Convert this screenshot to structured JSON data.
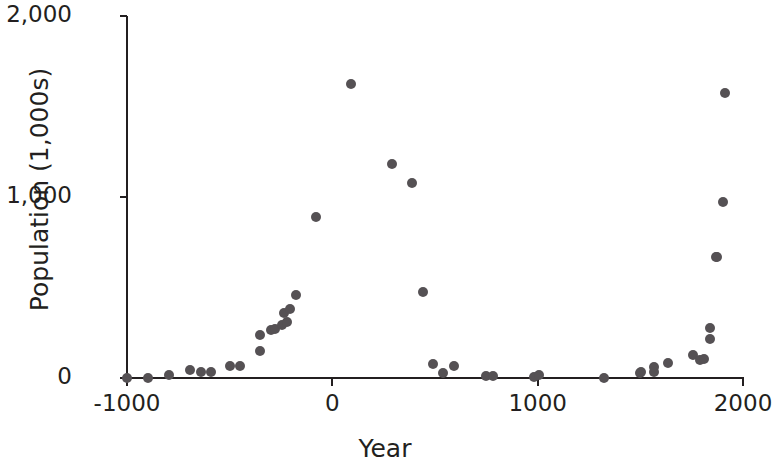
{
  "chart_data": {
    "type": "scatter",
    "title": "",
    "xlabel": "Year",
    "ylabel": "Population (1,000s)",
    "xlim": [
      -1000,
      2000
    ],
    "ylim": [
      0,
      2000
    ],
    "xticks": [
      -1000,
      0,
      1000,
      2000
    ],
    "xtick_labels": [
      "-1000",
      "0",
      "1000",
      "2000"
    ],
    "yticks": [
      0,
      1000,
      2000
    ],
    "ytick_labels": [
      "0",
      "1,000",
      "2,000"
    ],
    "grid": false,
    "legend": null,
    "marker": {
      "shape": "circle",
      "color": "#555154",
      "size_px": 10
    },
    "axis_color": "#231f20",
    "background": "#ffffff",
    "series": [
      {
        "name": "Population",
        "points": [
          {
            "x": -1000,
            "y": 0
          },
          {
            "x": -898,
            "y": 0
          },
          {
            "x": -796,
            "y": 17
          },
          {
            "x": -694,
            "y": 44
          },
          {
            "x": -641,
            "y": 33
          },
          {
            "x": -592,
            "y": 33
          },
          {
            "x": -500,
            "y": 66
          },
          {
            "x": -451,
            "y": 66
          },
          {
            "x": -350,
            "y": 149
          },
          {
            "x": -350,
            "y": 237
          },
          {
            "x": -301,
            "y": 264
          },
          {
            "x": -277,
            "y": 270
          },
          {
            "x": -243,
            "y": 292
          },
          {
            "x": -233,
            "y": 358
          },
          {
            "x": -223,
            "y": 309
          },
          {
            "x": -204,
            "y": 380
          },
          {
            "x": -175,
            "y": 457
          },
          {
            "x": -78,
            "y": 887
          },
          {
            "x": 92,
            "y": 1625
          },
          {
            "x": 291,
            "y": 1184
          },
          {
            "x": 388,
            "y": 1080
          },
          {
            "x": 442,
            "y": 474
          },
          {
            "x": 490,
            "y": 77
          },
          {
            "x": 539,
            "y": 28
          },
          {
            "x": 592,
            "y": 66
          },
          {
            "x": 748,
            "y": 11
          },
          {
            "x": 782,
            "y": 11
          },
          {
            "x": 981,
            "y": 6
          },
          {
            "x": 1005,
            "y": 17
          },
          {
            "x": 1325,
            "y": 0
          },
          {
            "x": 1500,
            "y": 28
          },
          {
            "x": 1505,
            "y": 33
          },
          {
            "x": 1568,
            "y": 33
          },
          {
            "x": 1568,
            "y": 61
          },
          {
            "x": 1636,
            "y": 83
          },
          {
            "x": 1757,
            "y": 127
          },
          {
            "x": 1791,
            "y": 99
          },
          {
            "x": 1811,
            "y": 105
          },
          {
            "x": 1840,
            "y": 215
          },
          {
            "x": 1840,
            "y": 275
          },
          {
            "x": 1869,
            "y": 667
          },
          {
            "x": 1874,
            "y": 667
          },
          {
            "x": 1903,
            "y": 975
          },
          {
            "x": 1913,
            "y": 1576
          }
        ]
      }
    ]
  }
}
